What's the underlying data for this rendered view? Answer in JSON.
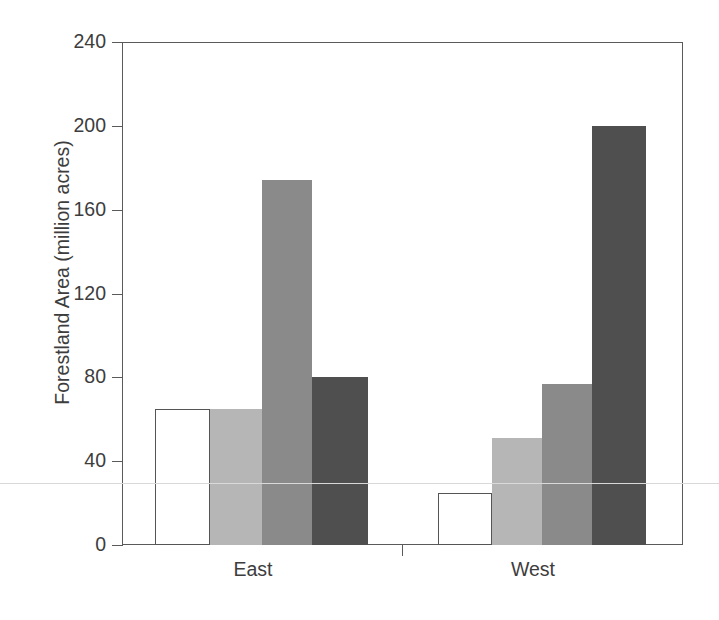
{
  "figure": {
    "background_color": "#ffffff",
    "axis_color": "#5a5a5a",
    "text_color": "#3d3d3d"
  },
  "axes": {
    "ylabel": "Forestland Area (million acres)",
    "yticks": [
      "0",
      "40",
      "80",
      "120",
      "160",
      "200",
      "240"
    ],
    "xticks": [
      "East",
      "West"
    ]
  },
  "chart_data": {
    "type": "bar",
    "title": "",
    "xlabel": "",
    "ylabel": "Forestland Area (million acres)",
    "ylim": [
      0,
      240
    ],
    "ytick_values": [
      0,
      40,
      80,
      120,
      160,
      200,
      240
    ],
    "grid": false,
    "legend": "none",
    "categories": [
      "East",
      "West"
    ],
    "series": [
      {
        "name": "series-1",
        "color": "#ffffff",
        "values": [
          65,
          25
        ]
      },
      {
        "name": "series-2",
        "color": "#b6b6b6",
        "values": [
          65,
          51
        ]
      },
      {
        "name": "series-3",
        "color": "#8a8a8a",
        "values": [
          174,
          77
        ]
      },
      {
        "name": "series-4",
        "color": "#4f4f4f",
        "values": [
          80,
          200
        ]
      }
    ]
  },
  "bars": [
    {
      "name": "bar-east-1",
      "group": "East",
      "series": "series-1",
      "value": 65,
      "color": "#ffffff",
      "left": 155,
      "width": 55
    },
    {
      "name": "bar-east-2",
      "group": "East",
      "series": "series-2",
      "value": 65,
      "color": "#b6b6b6",
      "left": 210,
      "width": 52
    },
    {
      "name": "bar-east-3",
      "group": "East",
      "series": "series-3",
      "value": 174,
      "color": "#8a8a8a",
      "left": 262,
      "width": 50
    },
    {
      "name": "bar-east-4",
      "group": "East",
      "series": "series-4",
      "value": 80,
      "color": "#4f4f4f",
      "left": 312,
      "width": 56
    },
    {
      "name": "bar-west-1",
      "group": "West",
      "series": "series-1",
      "value": 25,
      "color": "#ffffff",
      "left": 438,
      "width": 54
    },
    {
      "name": "bar-west-2",
      "group": "West",
      "series": "series-2",
      "value": 51,
      "color": "#b6b6b6",
      "left": 492,
      "width": 50
    },
    {
      "name": "bar-west-3",
      "group": "West",
      "series": "series-3",
      "value": 77,
      "color": "#8a8a8a",
      "left": 542,
      "width": 50
    },
    {
      "name": "bar-west-4",
      "group": "West",
      "series": "series-4",
      "value": 200,
      "color": "#4f4f4f",
      "left": 592,
      "width": 54
    }
  ],
  "geometry": {
    "plot_left": 122,
    "plot_right": 683,
    "plot_top": 42,
    "baseline_y": 545,
    "px_per_unit": 2.0958,
    "ytick_px": [
      545,
      461.2,
      377.3,
      293.5,
      209.7,
      125.8,
      42
    ],
    "xtick_px": [
      402
    ],
    "xlabel_center_px": [
      253,
      533
    ]
  }
}
